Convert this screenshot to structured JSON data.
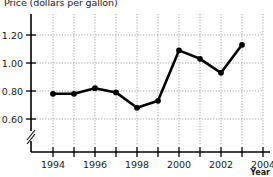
{
  "chart_data": {
    "type": "line",
    "title": "Price (dollars per gallon)",
    "xlabel": "Year",
    "ylabel": "",
    "x": [
      1994,
      1995,
      1996,
      1997,
      1998,
      1999,
      2000,
      2001,
      2002,
      2003
    ],
    "values": [
      0.78,
      0.78,
      0.82,
      0.79,
      0.68,
      0.73,
      1.09,
      1.03,
      0.93,
      1.13
    ],
    "series": [
      {
        "name": "Price",
        "values": [
          0.78,
          0.78,
          0.82,
          0.79,
          0.68,
          0.73,
          1.09,
          1.03,
          0.93,
          1.13
        ]
      }
    ],
    "xlim": [
      1993,
      2004.6
    ],
    "ylim": [
      0.5,
      1.3
    ],
    "y_ticks": [
      0.6,
      0.8,
      1.0,
      1.2
    ],
    "y_tick_labels": [
      "0.60",
      "0.80",
      "1.00",
      "1.20"
    ],
    "x_ticks": [
      1994,
      1995,
      1996,
      1997,
      1998,
      1999,
      2000,
      2001,
      2002,
      2003,
      2004
    ],
    "x_tick_labels_major": [
      "1994",
      "1996",
      "1998",
      "2000",
      "2002",
      "2004"
    ],
    "x_major_years": [
      1994,
      1996,
      1998,
      2000,
      2002,
      2004
    ],
    "grid": true,
    "grid_style": "dotted",
    "legend": "none",
    "axis_break": true,
    "marker": "filled-circle",
    "line_color": "#000000",
    "grid_color": "#9a9a9a",
    "axis_color": "#000000",
    "background": "#ffffff"
  },
  "labels": {
    "title": "Price (dollars per gallon)",
    "year_axis": "Year",
    "y_0_60": "0.60",
    "y_0_80": "0.80",
    "y_1_00": "1.00",
    "y_1_20": "1.20",
    "x_1994": "1994",
    "x_1996": "1996",
    "x_1998": "1998",
    "x_2000": "2000",
    "x_2002": "2002",
    "x_2004": "2004"
  }
}
